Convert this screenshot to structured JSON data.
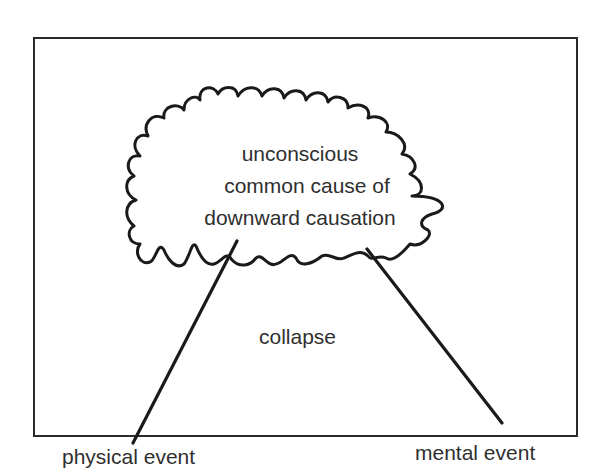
{
  "diagram": {
    "cloud": {
      "lines": [
        "unconscious",
        "common cause of",
        "downward causation"
      ]
    },
    "middle_label": "collapse",
    "left_label": "physical event",
    "right_label": "mental event"
  },
  "colors": {
    "stroke": "#1a1a1a",
    "frame": "#2b2b2b",
    "text": "#2f2f2f",
    "background": "#ffffff"
  }
}
